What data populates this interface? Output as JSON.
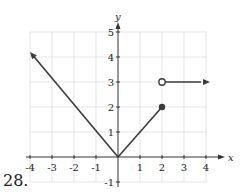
{
  "problem_number": "28.",
  "chart_data": {
    "type": "line",
    "title": "",
    "xlabel": "x",
    "ylabel": "y",
    "xlim": [
      -4,
      4
    ],
    "ylim": [
      -1,
      5
    ],
    "grid": true,
    "x_ticks": [
      "-4",
      "-3",
      "-2",
      "-1",
      "1",
      "2",
      "3",
      "4"
    ],
    "y_ticks": [
      "-1",
      "1",
      "2",
      "3",
      "4",
      "5"
    ],
    "series": [
      {
        "name": "left branch",
        "points": [
          [
            -4,
            4.2
          ],
          [
            0,
            0
          ]
        ],
        "arrow_start": true
      },
      {
        "name": "middle segment",
        "points": [
          [
            0,
            0
          ],
          [
            2,
            2
          ]
        ],
        "end_marker": "closed"
      },
      {
        "name": "right ray",
        "points": [
          [
            2,
            3
          ],
          [
            4,
            3
          ]
        ],
        "start_marker": "open",
        "arrow_end": true
      }
    ],
    "colors": {
      "line": "#3a3a3a",
      "grid": "#d8d8d8"
    }
  }
}
